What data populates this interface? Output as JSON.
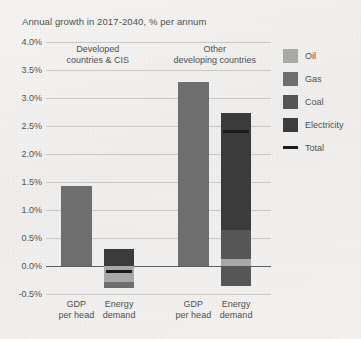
{
  "chart_data": {
    "type": "bar",
    "title": "Annual growth in 2017-2040, % per annum",
    "xlabel": "",
    "ylabel": "",
    "ylim": [
      -0.5,
      4.0
    ],
    "ytick_step": 0.5,
    "ytick_labels": [
      "4.0%",
      "3.5%",
      "3.0%",
      "2.5%",
      "2.0%",
      "1.5%",
      "1.0%",
      "0.5%",
      "0.0%",
      "-0.5%"
    ],
    "ytick_values": [
      4.0,
      3.5,
      3.0,
      2.5,
      2.0,
      1.5,
      1.0,
      0.5,
      0.0,
      -0.5
    ],
    "grid": true,
    "legend_position": "right",
    "stacked": true,
    "groups": [
      {
        "label_line1": "Developed",
        "label_line2": "countries & CIS"
      },
      {
        "label_line1": "Other",
        "label_line2": "developing countries"
      }
    ],
    "categories": [
      {
        "label_line1": "GDP",
        "label_line2": "per head",
        "group": 0
      },
      {
        "label_line1": "Energy",
        "label_line2": "demand",
        "group": 0
      },
      {
        "label_line1": "GDP",
        "label_line2": "per head",
        "group": 1
      },
      {
        "label_line1": "Energy",
        "label_line2": "demand",
        "group": 1
      }
    ],
    "legend_entries": [
      {
        "name": "Oil",
        "color": "#a8a8a6",
        "type": "swatch"
      },
      {
        "name": "Gas",
        "color": "#6e6e6e",
        "type": "swatch"
      },
      {
        "name": "Coal",
        "color": "#565656",
        "type": "swatch"
      },
      {
        "name": "Electricity",
        "color": "#3b3b3b",
        "type": "swatch"
      },
      {
        "name": "Total",
        "color": "#1b1b1b",
        "type": "line"
      }
    ],
    "bars": [
      {
        "id": "developed-gdp-per-head",
        "kind": "single",
        "value": 1.43,
        "color": "#6e6e6e"
      },
      {
        "id": "developed-energy-demand",
        "kind": "stacked",
        "total": -0.1,
        "positive_segments": [
          {
            "name": "Electricity",
            "value": 0.31,
            "color": "#3b3b3b"
          }
        ],
        "negative_segments": [
          {
            "name": "Oil",
            "value": -0.28,
            "color": "#a8a8a6"
          },
          {
            "name": "Coal",
            "value": -0.11,
            "color": "#6e6e6e"
          }
        ]
      },
      {
        "id": "other-developing-gdp-per-head",
        "kind": "single",
        "value": 3.28,
        "color": "#6e6e6e"
      },
      {
        "id": "other-developing-energy-demand",
        "kind": "stacked",
        "total": 2.4,
        "positive_segments": [
          {
            "name": "Oil",
            "value": 0.12,
            "color": "#a8a8a6"
          },
          {
            "name": "Gas",
            "value": 0.53,
            "color": "#565656"
          },
          {
            "name": "Electricity",
            "value": 2.08,
            "color": "#3b3b3b"
          }
        ],
        "negative_segments": [
          {
            "name": "Coal",
            "value": -0.35,
            "color": "#565656"
          }
        ]
      }
    ],
    "colors": {
      "background": "#f2f1ef",
      "grid": "#c9c8c6",
      "axis": "#5c5c5c",
      "text": "#4f4f4f",
      "total_line": "#1b1b1b"
    }
  }
}
